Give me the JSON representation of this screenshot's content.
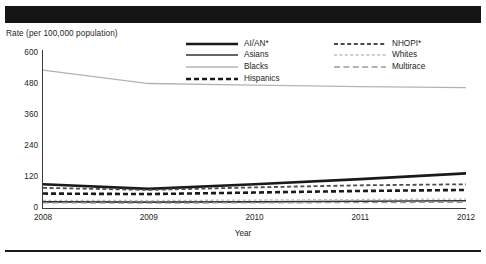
{
  "figure": {
    "top_band": "redacted-title-band",
    "bottom_rule": "footer-rule"
  },
  "chart_data": {
    "type": "line",
    "title": "",
    "xlabel": "Year",
    "ylabel": "Rate (per 100,000 population)",
    "x": [
      "2008",
      "2009",
      "2010",
      "2011",
      "2012"
    ],
    "categories": [
      "2008",
      "2009",
      "2010",
      "2011",
      "2012"
    ],
    "xlim": [
      2008,
      2012
    ],
    "ylim": [
      0,
      600
    ],
    "yticks": [
      "0",
      "120",
      "240",
      "360",
      "480",
      "600"
    ],
    "ytick_values": [
      0,
      120,
      240,
      360,
      480,
      600
    ],
    "grid": false,
    "legend_position": "top-center",
    "series": [
      {
        "name": "AI/AN*",
        "values": [
          88,
          70,
          88,
          108,
          130
        ],
        "style": "solid",
        "width": 2.6,
        "color": "#1a1a1a"
      },
      {
        "name": "Asians",
        "values": [
          20,
          19,
          20,
          22,
          24
        ],
        "style": "solid",
        "width": 1.6,
        "color": "#333333"
      },
      {
        "name": "Blacks",
        "values": [
          530,
          478,
          472,
          466,
          462
        ],
        "style": "solid",
        "width": 1.3,
        "color": "#b3b3b3"
      },
      {
        "name": "Hispanics",
        "values": [
          52,
          50,
          56,
          62,
          66
        ],
        "style": "dashed",
        "width": 2.6,
        "color": "#1a1a1a"
      },
      {
        "name": "NHOPI*",
        "values": [
          74,
          66,
          76,
          84,
          88
        ],
        "style": "dashed",
        "width": 1.8,
        "color": "#4d4d4d"
      },
      {
        "name": "Whites",
        "values": [
          26,
          25,
          27,
          29,
          31
        ],
        "style": "dotted",
        "width": 1.3,
        "color": "#bfbfbf"
      },
      {
        "name": "Multirace",
        "values": [
          16,
          15,
          16,
          17,
          18
        ],
        "style": "dashdash",
        "width": 1.3,
        "color": "#9a9a9a"
      }
    ],
    "legend": {
      "left_column": [
        "AI/AN*",
        "Asians",
        "Blacks",
        "Hispanics"
      ],
      "right_column": [
        "NHOPI*",
        "Whites",
        "Multirace"
      ]
    }
  }
}
